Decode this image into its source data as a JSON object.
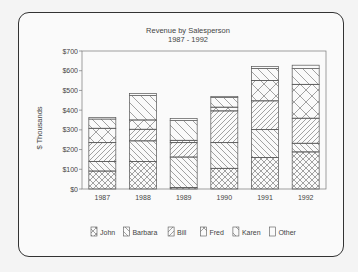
{
  "chart_data": {
    "type": "bar",
    "stacked": true,
    "title": "Revenue by Salesperson",
    "subtitle": "1987 - 1992",
    "xlabel": "",
    "ylabel": "$ Thousands",
    "ylim": [
      0,
      700
    ],
    "yticks": [
      "$0",
      "$100",
      "$200",
      "$300",
      "$400",
      "$500",
      "$600",
      "$700"
    ],
    "categories": [
      "1987",
      "1988",
      "1989",
      "1990",
      "1991",
      "1992"
    ],
    "grid": false,
    "legend_position": "bottom",
    "series": [
      {
        "name": "John",
        "pattern": "crosshatch-fine",
        "values": [
          91,
          140,
          8,
          105,
          159,
          188
        ]
      },
      {
        "name": "Barbara",
        "pattern": "diag-back",
        "values": [
          49,
          104,
          154,
          130,
          142,
          44
        ]
      },
      {
        "name": "Bill",
        "pattern": "diag-fwd",
        "values": [
          95,
          59,
          73,
          161,
          146,
          127
        ]
      },
      {
        "name": "Fred",
        "pattern": "crosshatch-wide",
        "values": [
          73,
          47,
          12,
          19,
          103,
          172
        ]
      },
      {
        "name": "Karen",
        "pattern": "diag-back-wide",
        "values": [
          47,
          124,
          100,
          49,
          62,
          80
        ]
      },
      {
        "name": "Other",
        "pattern": "open",
        "values": [
          7,
          10,
          10,
          6,
          10,
          17
        ]
      }
    ]
  }
}
